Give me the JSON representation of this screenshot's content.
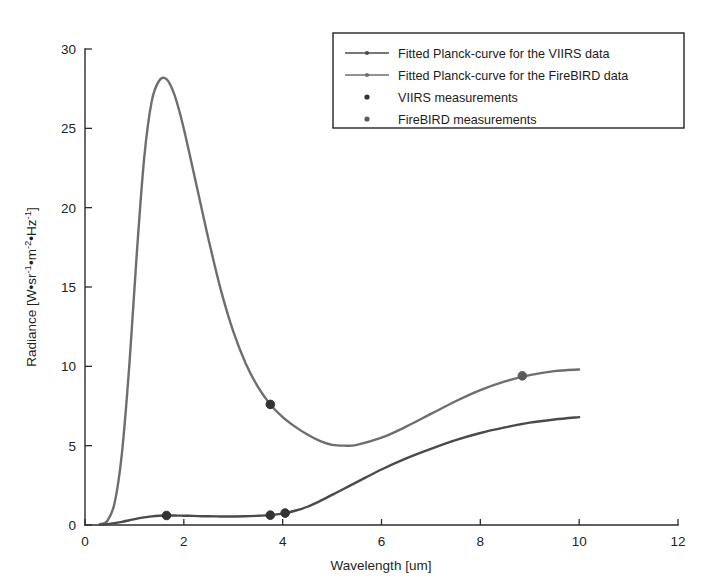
{
  "figure": {
    "background_color": "#ffffff",
    "plot_type": "line-with-markers"
  },
  "axes": {
    "x": {
      "label": "Wavelength [um]",
      "ticks": [
        0,
        2,
        4,
        6,
        8,
        10,
        12
      ],
      "tick_labels": [
        "0",
        "2",
        "4",
        "6",
        "8",
        "10",
        "12"
      ],
      "range": [
        0,
        12
      ]
    },
    "y": {
      "label_parts": {
        "prefix": "Radiance [W•sr",
        "exp1": "-1",
        "mid1": "•m",
        "exp2": "-2",
        "mid2": "•Hz",
        "exp3": "-1",
        "suffix": "]"
      },
      "label": "Radiance [W•sr -1•m -2•Hz -1]",
      "ticks": [
        0,
        5,
        10,
        15,
        20,
        25,
        30
      ],
      "tick_labels": [
        "0",
        "5",
        "10",
        "15",
        "20",
        "25",
        "30"
      ],
      "range": [
        0,
        30
      ]
    }
  },
  "legend": {
    "position": "top-right",
    "entries": [
      {
        "label": "Fitted Planck-curve for the VIIRS data",
        "marker": "line-with-dot",
        "color": "#4a4a4a"
      },
      {
        "label": "Fitted Planck-curve for the FireBIRD data",
        "marker": "line-with-dot",
        "color": "#6e6e6e"
      },
      {
        "label": "VIIRS measurements",
        "marker": "dot",
        "color": "#333333"
      },
      {
        "label": "FireBIRD measurements",
        "marker": "dot",
        "color": "#5a5a5a"
      }
    ]
  },
  "chart_data": {
    "type": "line",
    "title": "",
    "xlabel": "Wavelength [um]",
    "ylabel": "Radiance [W•sr-1•m-2•Hz-1]",
    "xlim": [
      0,
      12
    ],
    "ylim": [
      0,
      30
    ],
    "grid": false,
    "legend_position": "top-right",
    "x": [
      0.3,
      0.45,
      0.6,
      0.75,
      0.9,
      1.05,
      1.2,
      1.35,
      1.5,
      1.65,
      1.8,
      1.95,
      2.1,
      2.3,
      2.5,
      2.75,
      3.0,
      3.25,
      3.5,
      3.75,
      4.0,
      4.25,
      4.5,
      4.75,
      5.0,
      5.25,
      5.5,
      6.0,
      6.5,
      7.0,
      7.5,
      8.0,
      8.5,
      9.0,
      9.5,
      10.0
    ],
    "series": [
      {
        "name": "Fitted Planck-curve for the FireBIRD data",
        "color": "#6e6e6e",
        "values": [
          0.05,
          0.25,
          1.4,
          4.6,
          10.2,
          17.2,
          23.2,
          26.7,
          28.0,
          28.1,
          27.2,
          25.6,
          23.6,
          20.8,
          18.0,
          14.8,
          12.2,
          10.2,
          8.7,
          7.6,
          6.8,
          6.2,
          5.7,
          5.3,
          5.05,
          5.0,
          5.05,
          5.5,
          6.2,
          7.0,
          7.8,
          8.5,
          9.05,
          9.45,
          9.7,
          9.8
        ]
      },
      {
        "name": "Fitted Planck-curve for the VIIRS data",
        "color": "#4a4a4a",
        "values": [
          0.02,
          0.05,
          0.12,
          0.2,
          0.3,
          0.4,
          0.48,
          0.54,
          0.58,
          0.6,
          0.6,
          0.59,
          0.58,
          0.56,
          0.55,
          0.54,
          0.54,
          0.55,
          0.58,
          0.62,
          0.72,
          0.9,
          1.15,
          1.5,
          1.9,
          2.3,
          2.7,
          3.5,
          4.2,
          4.8,
          5.35,
          5.8,
          6.15,
          6.45,
          6.65,
          6.8
        ]
      }
    ],
    "markers": [
      {
        "series": "FireBIRD measurements",
        "x": 3.75,
        "y": 7.6,
        "color": "#333333"
      },
      {
        "series": "FireBIRD measurements",
        "x": 8.85,
        "y": 9.4,
        "color": "#5a5a5a"
      },
      {
        "series": "VIIRS measurements",
        "x": 1.65,
        "y": 0.6,
        "color": "#333333"
      },
      {
        "series": "VIIRS measurements",
        "x": 3.75,
        "y": 0.62,
        "color": "#333333"
      },
      {
        "series": "VIIRS measurements",
        "x": 4.05,
        "y": 0.75,
        "color": "#333333"
      }
    ]
  }
}
